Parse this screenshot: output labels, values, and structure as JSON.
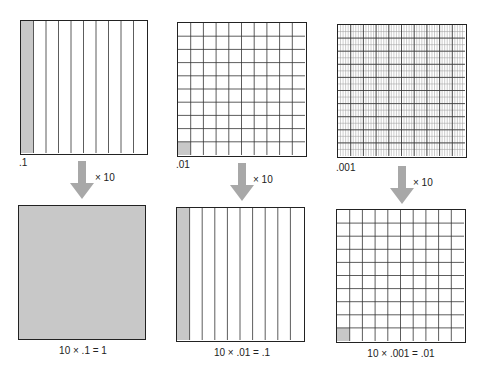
{
  "colors": {
    "shade": "#c8c8c8",
    "line": "#222222",
    "arrow": "#a8a8a8"
  },
  "panels": [
    {
      "top_label": ".1",
      "top_grid": {
        "cols": 10,
        "rows": 1,
        "shaded": "first-column"
      },
      "multiplier": "× 10",
      "bottom_grid": {
        "cols": 1,
        "rows": 1,
        "shaded": "all"
      },
      "caption": "10 × .1 = 1"
    },
    {
      "top_label": ".01",
      "top_grid": {
        "cols": 10,
        "rows": 10,
        "shaded": "bottom-left-cell"
      },
      "multiplier": "× 10",
      "bottom_grid": {
        "cols": 10,
        "rows": 1,
        "shaded": "first-column"
      },
      "caption": "10 × .01 = .1"
    },
    {
      "top_label": ".001",
      "top_grid": {
        "cols": 100,
        "rows": 10,
        "shaded": "none-visible"
      },
      "multiplier": "× 10",
      "bottom_grid": {
        "cols": 10,
        "rows": 10,
        "shaded": "bottom-left-cell"
      },
      "caption": "10 × .001 = .01"
    }
  ]
}
